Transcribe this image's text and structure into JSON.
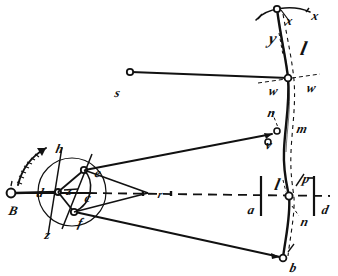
{
  "figure": {
    "kind": "hand-drawn mechanical linkage patent diagram",
    "background_color": "#ffffff",
    "ink_color": "#111111",
    "labels": [
      {
        "id": "label-x-left",
        "text": "x",
        "x": 286,
        "y": 14,
        "size": "md"
      },
      {
        "id": "label-x-right",
        "text": "x",
        "x": 312,
        "y": 9,
        "size": "md"
      },
      {
        "id": "label-y",
        "text": "y",
        "x": 269,
        "y": 30,
        "size": "lg"
      },
      {
        "id": "label-l-upper",
        "text": "l",
        "x": 301,
        "y": 38,
        "size": "xl"
      },
      {
        "id": "label-w-left",
        "text": "w",
        "x": 269,
        "y": 84,
        "size": "md"
      },
      {
        "id": "label-w-right",
        "text": "w",
        "x": 307,
        "y": 81,
        "size": "md"
      },
      {
        "id": "label-s",
        "text": "s",
        "x": 115,
        "y": 86,
        "size": "md"
      },
      {
        "id": "label-n-upper",
        "text": "n",
        "x": 268,
        "y": 106,
        "size": "md"
      },
      {
        "id": "label-m",
        "text": "m",
        "x": 297,
        "y": 122,
        "size": "md"
      },
      {
        "id": "label-v",
        "text": "v",
        "x": 266,
        "y": 138,
        "size": "md"
      },
      {
        "id": "label-l-lower",
        "text": "l",
        "x": 275,
        "y": 176,
        "size": "lg"
      },
      {
        "id": "label-p",
        "text": "p",
        "x": 303,
        "y": 172,
        "size": "md"
      },
      {
        "id": "label-a",
        "text": "a",
        "x": 248,
        "y": 203,
        "size": "md"
      },
      {
        "id": "label-d-right",
        "text": "d",
        "x": 322,
        "y": 203,
        "size": "md"
      },
      {
        "id": "label-n-lower",
        "text": "n",
        "x": 301,
        "y": 215,
        "size": "md"
      },
      {
        "id": "label-b-bottom",
        "text": "b",
        "x": 290,
        "y": 261,
        "size": "md"
      },
      {
        "id": "label-B",
        "text": "B",
        "x": 9,
        "y": 204,
        "size": "md"
      },
      {
        "id": "label-d-left",
        "text": "d",
        "x": 37,
        "y": 186,
        "size": "md"
      },
      {
        "id": "label-z-center",
        "text": "z",
        "x": 67,
        "y": 184,
        "size": "md"
      },
      {
        "id": "label-c",
        "text": "c",
        "x": 85,
        "y": 191,
        "size": "md"
      },
      {
        "id": "label-e",
        "text": "e",
        "x": 95,
        "y": 166,
        "size": "md"
      },
      {
        "id": "label-f",
        "text": "f",
        "x": 78,
        "y": 216,
        "size": "md"
      },
      {
        "id": "label-h",
        "text": "h",
        "x": 56,
        "y": 142,
        "size": "md"
      },
      {
        "id": "label-z-bottom",
        "text": "z",
        "x": 45,
        "y": 228,
        "size": "md"
      },
      {
        "id": "label-r",
        "text": "r",
        "x": 158,
        "y": 189,
        "size": "sm"
      }
    ],
    "joints": [
      {
        "id": "joint-top-x",
        "cx": 277,
        "cy": 8,
        "r": 3.2
      },
      {
        "id": "joint-s-end",
        "cx": 130,
        "cy": 72,
        "r": 3.2
      },
      {
        "id": "joint-w-cross",
        "cx": 288,
        "cy": 78,
        "r": 3.2
      },
      {
        "id": "joint-n",
        "cx": 277,
        "cy": 131,
        "r": 3.0
      },
      {
        "id": "joint-v",
        "cx": 268,
        "cy": 142,
        "r": 3.0
      },
      {
        "id": "joint-a-d-center",
        "cx": 289,
        "cy": 196,
        "r": 3.6
      },
      {
        "id": "joint-bottom-b",
        "cx": 283,
        "cy": 258,
        "r": 3.4
      },
      {
        "id": "joint-B-left",
        "cx": 10,
        "cy": 193,
        "r": 4.2
      },
      {
        "id": "joint-crank-center",
        "cx": 58,
        "cy": 192,
        "r": 3.0
      },
      {
        "id": "joint-e",
        "cx": 84,
        "cy": 170,
        "r": 3.2
      },
      {
        "id": "joint-f",
        "cx": 74,
        "cy": 212,
        "r": 3.2
      }
    ],
    "crank_circle": {
      "cx": 72,
      "cy": 192,
      "r": 34
    },
    "rotation_arrow": "curved-arrow-counterclockwise"
  }
}
